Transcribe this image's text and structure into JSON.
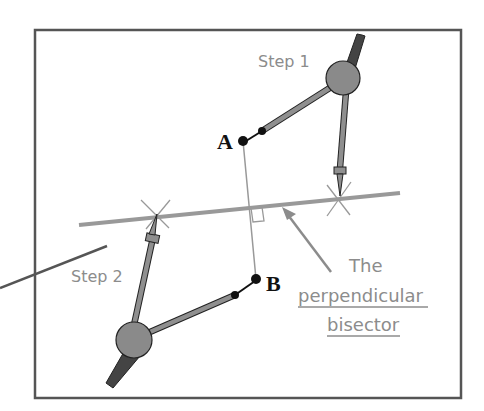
{
  "labels": {
    "step1": "Step 1",
    "step2": "Step 2",
    "point_a": "A",
    "point_b": "B",
    "note_line1": "The",
    "note_line2": "perpendicular",
    "note_line3": "bisector"
  },
  "colors": {
    "frame": "#555555",
    "bisector": "#999999",
    "segment": "#999999",
    "compass_arm": "#8f8f8f",
    "compass_hinge": "#8a8a8a",
    "compass_handle": "#444444",
    "point": "#111111",
    "text_gray": "#8c8c8c"
  }
}
